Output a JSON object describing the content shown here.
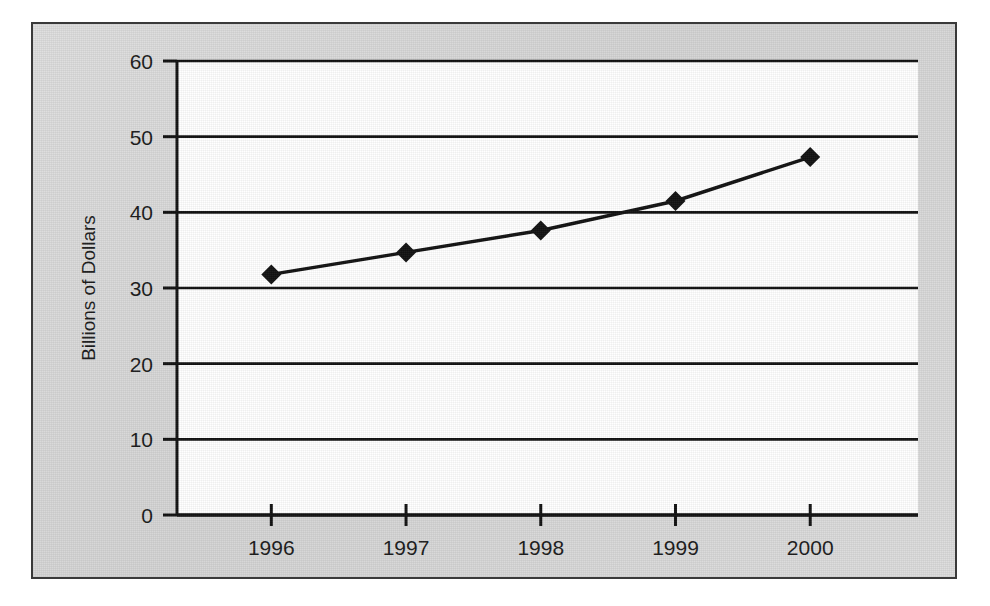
{
  "figure": {
    "panel_bg_color": "#d9d9d9",
    "plot_bg_color": "#ffffff",
    "ink_color": "#111111",
    "border_color": "#3a3a3a"
  },
  "chart_data": {
    "type": "line",
    "title": "",
    "xlabel": "",
    "ylabel": "Billions of Dollars",
    "categories": [
      "1996",
      "1997",
      "1998",
      "1999",
      "2000"
    ],
    "values": [
      31.8,
      34.7,
      37.6,
      41.5,
      47.3
    ],
    "series": [
      {
        "name": "Billions of Dollars",
        "values": [
          31.8,
          34.7,
          37.6,
          41.5,
          47.3
        ],
        "marker": "diamond",
        "marker_color": "#111111",
        "line_color": "#111111"
      }
    ],
    "ylim": [
      0,
      60
    ],
    "yticks": [
      0,
      10,
      20,
      30,
      40,
      50,
      60
    ],
    "ytick_labels": [
      "0",
      "10",
      "20",
      "30",
      "40",
      "50",
      "60"
    ],
    "xtick_labels": [
      "1996",
      "1997",
      "1998",
      "1999",
      "2000"
    ],
    "grid": "horizontal",
    "legend": "none"
  }
}
